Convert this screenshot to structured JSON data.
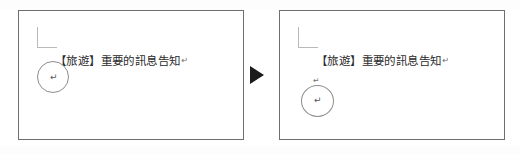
{
  "figure": {
    "type": "before-after-comparison",
    "arrow_icon": "solid-right-triangle-icon"
  },
  "panels": [
    {
      "id": "before",
      "role": "before-state",
      "document_text": "【旅遊】重要的訊息告知",
      "trailing_paragraph_mark": "↵",
      "corner_mark_icon": "text-boundary-corner-icon",
      "annotation": {
        "shape": "circle-annotation",
        "contents": [
          {
            "kind": "paragraph-mark",
            "glyph": "↵"
          }
        ]
      },
      "standalone_marks": []
    },
    {
      "id": "after",
      "role": "after-state",
      "document_text": "【旅遊】重要的訊息告知",
      "trailing_paragraph_mark": "↵",
      "corner_mark_icon": "text-boundary-corner-icon",
      "annotation": {
        "shape": "circle-annotation",
        "contents": [
          {
            "kind": "paragraph-mark",
            "glyph": "↵"
          }
        ]
      },
      "standalone_marks": [
        {
          "kind": "paragraph-mark",
          "glyph": "↵"
        }
      ]
    }
  ],
  "colors": {
    "page_background": "#ffffff",
    "panel_border": "#6f6f6f",
    "corner_mark": "#b9b9b9",
    "document_text": "#2b2b2b",
    "paragraph_mark": "#57575c",
    "annotation_circle": "#8d8d8d",
    "arrow": "#1b1b1b"
  }
}
